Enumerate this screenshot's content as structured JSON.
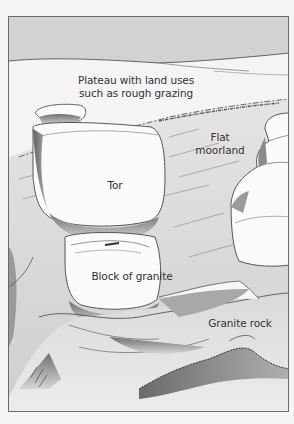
{
  "figure": {
    "type": "illustration",
    "colors": {
      "sky": "#d2d2d2",
      "plateau": "#f4f4f4",
      "moorland": "#dedede",
      "rock_light": "#fafafa",
      "rock_shadow": "#8c8c8c",
      "outline": "#555555",
      "label_text": "#333333",
      "frame_border": "#6a6a6a"
    },
    "labels": {
      "plateau": "Plateau with land uses such as rough grazing",
      "plateau_line1": "Plateau with land uses",
      "plateau_line2": "such as rough grazing",
      "moorland_line1": "Flat",
      "moorland_line2": "moorland",
      "tor": "Tor",
      "block": "Block of granite",
      "granite_rock": "Granite rock"
    }
  }
}
